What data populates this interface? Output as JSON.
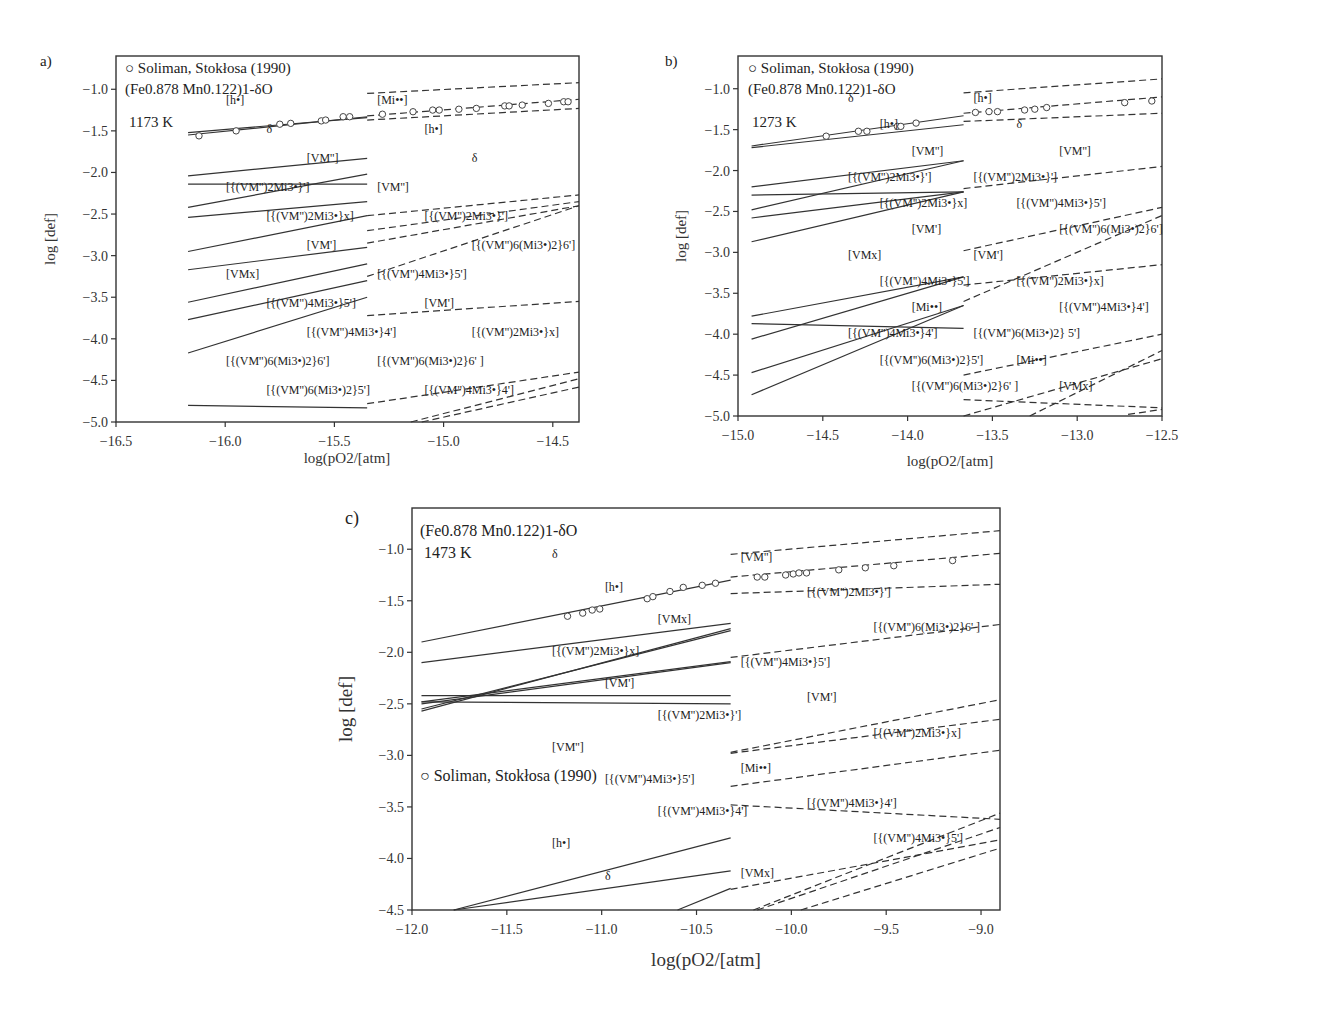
{
  "chart_data": [
    {
      "panel": "a)",
      "type": "line",
      "title": "",
      "xlabel": "log(pO2/[atm]",
      "ylabel": "log [def]",
      "xlim": [
        -16.5,
        -14.38
      ],
      "ylim": [
        -5.0,
        -0.6
      ],
      "xticks": [
        -16.5,
        -16.0,
        -15.5,
        -15.0,
        -14.5
      ],
      "yticks": [
        -5.0,
        -4.5,
        -4.0,
        -3.5,
        -3.0,
        -2.5,
        -2.0,
        -1.5,
        -1.0
      ],
      "xtick_labels": [
        "−16.5",
        "−16.0",
        "−15.5",
        "−15.0",
        "−14.5"
      ],
      "ytick_labels": [
        "−5.0",
        "−4.5",
        "−4.0",
        "−3.5",
        "−3.0",
        "−2.5",
        "−2.0",
        "−1.5",
        "−1.0"
      ],
      "legend": "○ Soliman, Stokłosa (1990)",
      "compound": "(Fe0.878 Mn0.122)1-δO",
      "temperature": "1173 K",
      "split_x": -15.35,
      "series": [
        {
          "name": "[h•]",
          "x": [
            -16.17,
            -15.35
          ],
          "y": [
            -1.52,
            -1.34
          ],
          "dashed_x": [
            -15.35,
            -14.38
          ],
          "dashed_y": [
            -1.05,
            -0.92
          ]
        },
        {
          "name": "δ",
          "x": [
            -16.17,
            -15.35
          ],
          "y": [
            -1.55,
            -1.33
          ],
          "dashed_x": [
            -15.35,
            -14.38
          ],
          "dashed_y": [
            -1.32,
            -1.12
          ]
        },
        {
          "name": "[VM'']",
          "x": [
            -16.17,
            -15.35
          ],
          "y": [
            -2.04,
            -1.83
          ],
          "dashed_x": [
            -15.35,
            -14.38
          ],
          "dashed_y": [
            -1.37,
            -1.23
          ]
        },
        {
          "name": "[{(VM'')2Mi3•}x]",
          "x": [
            -16.17,
            -15.35
          ],
          "y": [
            -2.14,
            -2.14
          ]
        },
        {
          "name": "[{(VM'')2Mi3•}']",
          "x": [
            -16.17,
            -15.35
          ],
          "y": [
            -2.42,
            -2.02
          ],
          "dashed_x": [
            -15.35,
            -14.38
          ],
          "dashed_y": [
            -2.52,
            -2.27
          ]
        },
        {
          "name": "[VM']",
          "x": [
            -16.17,
            -15.35
          ],
          "y": [
            -2.54,
            -2.35
          ],
          "dashed_x": [
            -15.35,
            -14.38
          ],
          "dashed_y": [
            -3.72,
            -3.55
          ]
        },
        {
          "name": "[VMx]",
          "x": [
            -16.17,
            -15.35
          ],
          "y": [
            -2.95,
            -2.52
          ],
          "dashed_x": [
            -15.35,
            -14.38
          ],
          "dashed_y": [
            -2.7,
            -2.35
          ]
        },
        {
          "name": "[{(VM'')4Mi3•}5']",
          "x": [
            -16.17,
            -15.35
          ],
          "y": [
            -3.17,
            -2.9
          ],
          "dashed_x": [
            -15.35,
            -14.38
          ],
          "dashed_y": [
            -2.85,
            -2.4
          ]
        },
        {
          "name": "[{(VM'')4Mi3•}4']",
          "x": [
            -16.17,
            -15.35
          ],
          "y": [
            -3.56,
            -3.1
          ],
          "dashed_x": [
            -15.15,
            -14.38
          ],
          "dashed_y": [
            -5.0,
            -4.48
          ]
        },
        {
          "name": "[{(VM'')6(Mi3•)2}6']",
          "x": [
            -16.17,
            -15.35
          ],
          "y": [
            -3.77,
            -3.3
          ],
          "dashed_x": [
            -15.35,
            -14.38
          ],
          "dashed_y": [
            -3.25,
            -2.4
          ]
        },
        {
          "name": "[{(VM'')6(Mi3•)2}5']",
          "x": [
            -16.17,
            -15.35
          ],
          "y": [
            -4.17,
            -3.5
          ]
        },
        {
          "name": "[Mi••]",
          "x": [
            -16.17,
            -15.35
          ],
          "y": [
            -4.8,
            -4.83
          ]
        },
        {
          "name": "[{(VM'')2Mi3•}x] (dashed)",
          "x": [],
          "y": [],
          "dashed_x": [
            -15.35,
            -14.38
          ],
          "dashed_y": [
            -4.78,
            -4.4
          ]
        },
        {
          "name": "[{(VM'')6(Mi3•)2}6'] (dashed, high)",
          "x": [],
          "y": [],
          "dashed_x": [
            -15.1,
            -14.38
          ],
          "dashed_y": [
            -5.0,
            -4.58
          ]
        }
      ],
      "points": {
        "x": [
          -16.12,
          -15.95,
          -15.75,
          -15.7,
          -15.56,
          -15.54,
          -15.46,
          -15.43,
          -15.28,
          -15.14,
          -15.05,
          -15.02,
          -14.93,
          -14.85,
          -14.72,
          -14.7,
          -14.64,
          -14.52,
          -14.45,
          -14.43
        ],
        "y": [
          -1.56,
          -1.5,
          -1.42,
          -1.41,
          -1.38,
          -1.37,
          -1.33,
          -1.33,
          -1.3,
          -1.27,
          -1.25,
          -1.25,
          -1.24,
          -1.23,
          -1.2,
          -1.2,
          -1.19,
          -1.17,
          -1.15,
          -1.15
        ]
      },
      "annotations": [
        "[h•]",
        "δ",
        "[VM'']",
        "[{(VM'')2Mi3•}']",
        "[{(VM'')2Mi3•}x]",
        "[VM']",
        "[VMx]",
        "[{(VM'')4Mi3•}5']",
        "[{(VM'')4Mi3•}4']",
        "[{(VM'')6(Mi3•)2}6']",
        "[{(VM'')6(Mi3•)2}5']",
        "[Mi••]",
        "[h•]",
        "δ",
        "[VM'']",
        "[{(VM'')2Mi3•}']",
        "[{(VM'')6(Mi3•)2}6']",
        "[{(VM'')4Mi3•}5']",
        "[VM']",
        "[{(VM'')2Mi3•}x]",
        "[{(VM'')6(Mi3•)2}6' ]",
        "[{(VM'')4Mi3•}4']"
      ]
    },
    {
      "panel": "b)",
      "type": "line",
      "title": "",
      "xlabel": "log(pO2/[atm]",
      "ylabel": "log [def]",
      "xlim": [
        -15.0,
        -12.5
      ],
      "ylim": [
        -5.0,
        -0.6
      ],
      "xticks": [
        -15.0,
        -14.5,
        -14.0,
        -13.5,
        -13.0,
        -12.5
      ],
      "yticks": [
        -5.0,
        -4.5,
        -4.0,
        -3.5,
        -3.0,
        -2.5,
        -2.0,
        -1.5,
        -1.0
      ],
      "xtick_labels": [
        "−15.0",
        "−14.5",
        "−14.0",
        "−13.5",
        "−13.0",
        "−12.5"
      ],
      "ytick_labels": [
        "−5.0",
        "−4.5",
        "−4.0",
        "−3.5",
        "−3.0",
        "−2.5",
        "−2.0",
        "−1.5",
        "−1.0"
      ],
      "legend": "○ Soliman, Stokłosa (1990)",
      "compound": "(Fe0.878 Mn0.122)1-δO",
      "temperature": "1273 K",
      "split_x": -13.67,
      "series": [
        {
          "name": "δ",
          "x": [
            -14.92,
            -13.67
          ],
          "y": [
            -1.7,
            -1.33
          ],
          "dashed_x": [
            -13.67,
            -12.5
          ],
          "dashed_y": [
            -1.3,
            -1.1
          ]
        },
        {
          "name": "[h•]",
          "x": [
            -14.92,
            -13.67
          ],
          "y": [
            -1.72,
            -1.44
          ],
          "dashed_x": [
            -13.67,
            -12.5
          ],
          "dashed_y": [
            -1.05,
            -0.88
          ]
        },
        {
          "name": "[VM'']",
          "x": [
            -14.92,
            -13.67
          ],
          "y": [
            -2.3,
            -2.26
          ],
          "dashed_x": [
            -13.67,
            -12.5
          ],
          "dashed_y": [
            -1.4,
            -1.3
          ]
        },
        {
          "name": "[{(VM'')2Mi3•}']",
          "x": [
            -14.92,
            -13.67
          ],
          "y": [
            -2.2,
            -1.88
          ],
          "dashed_x": [
            -13.67,
            -12.5
          ],
          "dashed_y": [
            -2.22,
            -1.95
          ]
        },
        {
          "name": "[{(VM'')2Mi3•}x]",
          "x": [
            -14.92,
            -13.67
          ],
          "y": [
            -2.48,
            -1.88
          ],
          "dashed_x": [
            -13.67,
            -12.5
          ],
          "dashed_y": [
            -4.5,
            -4.0
          ]
        },
        {
          "name": "[VM']",
          "x": [
            -14.92,
            -13.67
          ],
          "y": [
            -2.58,
            -2.26
          ],
          "dashed_x": [
            -13.67,
            -12.5
          ],
          "dashed_y": [
            -3.4,
            -3.15
          ]
        },
        {
          "name": "[VMx]",
          "x": [
            -14.92,
            -13.67
          ],
          "y": [
            -2.87,
            -2.26
          ],
          "dashed_x": [
            -12.7,
            -12.5
          ],
          "dashed_y": [
            -4.98,
            -4.92
          ]
        },
        {
          "name": "[{(VM'')4Mi3•}5']",
          "x": [
            -14.92,
            -13.67
          ],
          "y": [
            -3.78,
            -3.3
          ],
          "dashed_x": [
            -13.67,
            -12.5
          ],
          "dashed_y": [
            -2.98,
            -2.45
          ]
        },
        {
          "name": "[Mi••]",
          "x": [
            -14.92,
            -13.67
          ],
          "y": [
            -3.87,
            -3.93
          ],
          "dashed_x": [
            -13.67,
            -12.5
          ],
          "dashed_y": [
            -4.8,
            -4.9
          ]
        },
        {
          "name": "[{(VM'')4Mi3•}4']",
          "x": [
            -14.92,
            -13.67
          ],
          "y": [
            -4.06,
            -3.3
          ],
          "dashed_x": [
            -13.67,
            -12.5
          ],
          "dashed_y": [
            -5.0,
            -4.3
          ]
        },
        {
          "name": "[{(VM'')6(Mi3•)2}6']",
          "x": [
            -14.92,
            -13.67
          ],
          "y": [
            -4.47,
            -3.65
          ],
          "dashed_x": [
            -13.67,
            -12.5
          ],
          "dashed_y": [
            -3.6,
            -2.55
          ]
        },
        {
          "name": "[{(VM'')6(Mi3•)2}5']",
          "x": [
            -14.92,
            -13.67
          ],
          "y": [
            -4.74,
            -3.65
          ],
          "dashed_x": [
            -13.28,
            -12.5
          ],
          "dashed_y": [
            -5.0,
            -4.2
          ]
        }
      ],
      "points": {
        "x": [
          -14.48,
          -14.29,
          -14.24,
          -14.06,
          -14.04,
          -13.95,
          -13.6,
          -13.52,
          -13.47,
          -13.31,
          -13.25,
          -13.18,
          -12.72,
          -12.56
        ],
        "y": [
          -1.58,
          -1.52,
          -1.52,
          -1.46,
          -1.46,
          -1.42,
          -1.29,
          -1.28,
          -1.28,
          -1.26,
          -1.25,
          -1.23,
          -1.17,
          -1.15
        ]
      },
      "annotations": [
        "δ",
        "[h•]",
        "[VM'']",
        "[{(VM'')2Mi3•}']",
        "[{(VM'')2Mi3•}x]",
        "[VM']",
        "[VMx]",
        "[{(VM'')4Mi3•}5']",
        "[Mi••]",
        "[{(VM'')4Mi3•}4']",
        "[{(VM'')6(Mi3•)2}5']",
        "[{(VM'')6(Mi3•)2}6' ]",
        "[h•]",
        "δ",
        "[VM'']",
        "[{(VM'')2Mi3•}']",
        "[{(VM'')4Mi3•}5']",
        "[{(VM'')6(Mi3•)2}6']",
        "[VM']",
        "[{(VM'')2Mi3•}x]",
        "[{(VM'')4Mi3•}4']",
        "[{(VM'')6(Mi3•)2} 5']",
        "[Mi••]",
        "[VMx]"
      ]
    },
    {
      "panel": "c)",
      "type": "line",
      "title": "",
      "xlabel": "log(pO2/[atm]",
      "ylabel": "log [def]",
      "xlim": [
        -12.0,
        -8.9
      ],
      "ylim": [
        -4.5,
        -0.6
      ],
      "xticks": [
        -12.0,
        -11.5,
        -11.0,
        -10.5,
        -10.0,
        -9.5,
        -9.0
      ],
      "yticks": [
        -4.5,
        -4.0,
        -3.5,
        -3.0,
        -2.5,
        -2.0,
        -1.5,
        -1.0
      ],
      "xtick_labels": [
        "−12.0",
        "−11.5",
        "−11.0",
        "−10.5",
        "−10.0",
        "−9.5",
        "−9.0"
      ],
      "ytick_labels": [
        "−4.5",
        "−4.0",
        "−3.5",
        "−3.0",
        "−2.5",
        "−2.0",
        "−1.5",
        "−1.0"
      ],
      "legend": "○ Soliman, Stokłosa (1990)",
      "compound": "(Fe0.878 Mn0.122)1-δO",
      "temperature": "1473 K",
      "split_x": -10.32,
      "series": [
        {
          "name": "δ",
          "x": [
            -11.95,
            -10.32
          ],
          "y": [
            -1.9,
            -1.3
          ],
          "dashed_x": [
            -10.32,
            -8.9
          ],
          "dashed_y": [
            -1.27,
            -1.04
          ]
        },
        {
          "name": "[h•]",
          "x": [
            -11.95,
            -10.32
          ],
          "y": [
            -2.1,
            -1.72
          ],
          "dashed_x": [
            -10.32,
            -8.9
          ],
          "dashed_y": [
            -1.05,
            -0.82
          ]
        },
        {
          "name": "[VMx]",
          "x": [
            -11.95,
            -10.32
          ],
          "y": [
            -2.57,
            -1.77
          ],
          "dashed_x": [
            -10.32,
            -8.9
          ],
          "dashed_y": [
            -4.3,
            -3.82
          ]
        },
        {
          "name": "[{(VM'')2Mi3•}x]",
          "x": [
            -11.95,
            -10.32
          ],
          "y": [
            -2.55,
            -1.79
          ],
          "dashed_x": [
            -10.32,
            -8.9
          ],
          "dashed_y": [
            -3.3,
            -2.95
          ]
        },
        {
          "name": "[VM']",
          "x": [
            -11.95,
            -10.32
          ],
          "y": [
            -2.5,
            -2.1
          ],
          "dashed_x": [
            -10.32,
            -8.9
          ],
          "dashed_y": [
            -2.98,
            -2.65
          ]
        },
        {
          "name": "[{(VM'')2Mi3•}']",
          "x": [
            -11.95,
            -10.32
          ],
          "y": [
            -2.48,
            -2.09
          ],
          "dashed_x": [
            -10.32,
            -8.9
          ],
          "dashed_y": [
            -2.05,
            -1.73
          ]
        },
        {
          "name": "[VM'']",
          "x": [
            -11.95,
            -10.32
          ],
          "y": [
            -2.42,
            -2.42
          ],
          "dashed_x": [
            -10.32,
            -8.9
          ],
          "dashed_y": [
            -1.43,
            -1.34
          ]
        },
        {
          "name": "[VM''] (low)",
          "x": [
            -11.95,
            -10.32
          ],
          "y": [
            -2.48,
            -2.5
          ]
        },
        {
          "name": "[{(VM'')4Mi3•}4']",
          "x": [
            -11.78,
            -10.32
          ],
          "y": [
            -4.5,
            -3.8
          ],
          "dashed_x": [
            -10.2,
            -8.9
          ],
          "dashed_y": [
            -4.5,
            -3.56
          ]
        },
        {
          "name": "[{(VM'')4Mi3•}5']",
          "x": [
            -11.78,
            -10.32
          ],
          "y": [
            -4.5,
            -4.12
          ],
          "dashed_x": [
            -10.18,
            -8.9
          ],
          "dashed_y": [
            -4.5,
            -3.7
          ]
        },
        {
          "name": "[{(VM'')6(Mi3•)2}6']",
          "x": [
            -10.6,
            -10.32
          ],
          "y": [
            -4.5,
            -4.29
          ],
          "dashed_x": [
            -10.32,
            -8.9
          ],
          "dashed_y": [
            -2.97,
            -2.46
          ]
        },
        {
          "name": "[Mi••]",
          "x": [],
          "y": [],
          "dashed_x": [
            -10.32,
            -8.9
          ],
          "dashed_y": [
            -3.48,
            -3.62
          ]
        },
        {
          "name": "[{(VM'')6(Mi3•)2}5'] (dashed)",
          "x": [],
          "y": [],
          "dashed_x": [
            -9.95,
            -8.9
          ],
          "dashed_y": [
            -4.5,
            -3.9
          ]
        }
      ],
      "points": {
        "x": [
          -11.18,
          -11.1,
          -11.05,
          -11.01,
          -10.76,
          -10.73,
          -10.64,
          -10.57,
          -10.47,
          -10.4,
          -10.18,
          -10.14,
          -10.03,
          -9.99,
          -9.96,
          -9.92,
          -9.75,
          -9.61,
          -9.46,
          -9.15
        ],
        "y": [
          -1.65,
          -1.62,
          -1.59,
          -1.58,
          -1.48,
          -1.46,
          -1.41,
          -1.37,
          -1.35,
          -1.33,
          -1.27,
          -1.27,
          -1.25,
          -1.24,
          -1.23,
          -1.23,
          -1.2,
          -1.18,
          -1.16,
          -1.11
        ]
      },
      "annotations": [
        "δ",
        "[h•]",
        "[VMx]",
        "[{(VM'')2Mi3•}x]",
        "[VM']",
        "[{(VM'')2Mi3•}']",
        "[VM'']",
        "[{(VM'')4Mi3•}5']",
        "[{(VM'')4Mi3•}4']",
        "[h•]",
        "δ",
        "[VM'']",
        "[{(VM'')2Mi3•}']",
        "[{(VM'')6(Mi3•)2}6' ]",
        "[{(VM'')4Mi3•}5']",
        "[VM']",
        "[{(VM'')2Mi3•}x]",
        "[Mi••]",
        "[{(VM'')4Mi3•}4']",
        "[{(VM'')4Mi3•}5']",
        "[VMx]"
      ]
    }
  ]
}
